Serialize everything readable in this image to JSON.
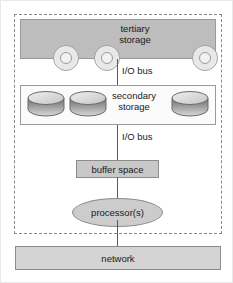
{
  "diagram": {
    "type": "block-diagram",
    "colors": {
      "tertiary_band_fill": "#bdbdbd",
      "secondary_band_fill": "#fbfbfb",
      "buffer_fill": "#c8c8c8",
      "processor_fill": "#cccccc",
      "network_fill": "#d4d4d4",
      "outline": "#8c8c8c",
      "boundary_dash": "#8a8a8a",
      "bus_line": "#5a5a5a",
      "text": "#1a1a1a"
    },
    "system_boundary": {
      "style": "dashed",
      "label": ""
    },
    "tertiary": {
      "label_line1": "tertiary",
      "label_line2": "storage",
      "media_count": 3,
      "media_icon": "optical-disc-icon"
    },
    "secondary": {
      "label_line1": "secondary",
      "label_line2": "storage",
      "media_count": 3,
      "media_icon": "disk-cylinder-icon"
    },
    "buses": [
      {
        "label": "I/O bus"
      },
      {
        "label": "I/O bus"
      }
    ],
    "buffer": {
      "label": "buffer space"
    },
    "processor": {
      "label": "processor(s)"
    },
    "network": {
      "label": "network"
    }
  }
}
